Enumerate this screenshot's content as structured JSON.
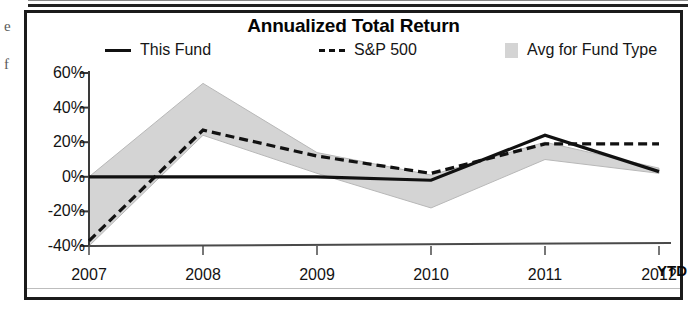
{
  "card": {
    "title": "Annualized Total Return"
  },
  "legend": {
    "items": [
      {
        "label": "This Fund",
        "marker": "solid-line-swatch",
        "color": "#111111"
      },
      {
        "label": "S&P 500",
        "marker": "dashed-line-swatch",
        "color": "#111111"
      },
      {
        "label": "Avg for Fund Type",
        "marker": "shaded-band-swatch",
        "color": "#d4d4d4"
      }
    ]
  },
  "axes": {
    "y_ticks": [
      "60%",
      "40%",
      "20%",
      "0%",
      "-20%",
      "-40%"
    ],
    "x_ticks": [
      "2007",
      "2008",
      "2009",
      "2010",
      "2011",
      "2012"
    ],
    "x_suffix": "YTD"
  },
  "artifacts": {
    "marks": [
      "e",
      "f"
    ]
  },
  "chart_data": {
    "type": "line",
    "title": "Annualized Total Return",
    "xlabel": "",
    "ylabel": "",
    "categories": [
      "2007",
      "2008",
      "2009",
      "2010",
      "2011",
      "2012 YTD"
    ],
    "ylim": [
      -40,
      60
    ],
    "ytick_values": [
      60,
      40,
      20,
      0,
      -20,
      -40
    ],
    "ytick_labels": [
      "60%",
      "40%",
      "20%",
      "0%",
      "-20%",
      "-40%"
    ],
    "grid": false,
    "legend_position": "top",
    "zero_line": 0,
    "series": [
      {
        "name": "This Fund",
        "style": "solid",
        "color": "#111111",
        "values": [
          0,
          0,
          0,
          -2,
          24,
          3
        ]
      },
      {
        "name": "S&P 500",
        "style": "dashed",
        "color": "#111111",
        "values": [
          -37,
          27,
          12,
          2,
          19,
          19
        ]
      }
    ],
    "band": {
      "name": "Avg for Fund Type",
      "style": "shaded-range",
      "color": "#d4d4d4",
      "upper": [
        0,
        54,
        14,
        1,
        20,
        5
      ],
      "lower": [
        -40,
        24,
        2,
        -18,
        10,
        2
      ]
    }
  }
}
